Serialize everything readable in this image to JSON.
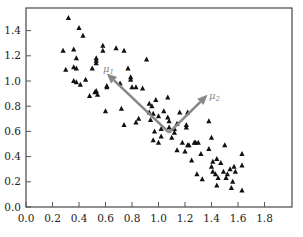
{
  "chart_data": {
    "type": "scatter",
    "title": "",
    "xlabel": "",
    "ylabel": "",
    "xlim": [
      0.0,
      2.0
    ],
    "ylim": [
      0.0,
      1.58
    ],
    "grid": false,
    "legend": null,
    "x_ticks": [
      "0.0",
      "0.2",
      "0.4",
      "0.6",
      "0.8",
      "1.0",
      "1.2",
      "1.4",
      "1.6",
      "1.8"
    ],
    "y_ticks": [
      "0.0",
      "0.2",
      "0.4",
      "0.6",
      "0.8",
      "1.0",
      "1.2",
      "1.4"
    ],
    "marker": "triangle",
    "marker_color": "#111111",
    "points": [
      [
        0.32,
        1.5
      ],
      [
        0.4,
        1.42
      ],
      [
        0.43,
        1.36
      ],
      [
        0.28,
        1.24
      ],
      [
        0.36,
        1.25
      ],
      [
        0.58,
        1.28
      ],
      [
        0.58,
        1.24
      ],
      [
        0.68,
        1.26
      ],
      [
        0.74,
        1.24
      ],
      [
        0.53,
        1.18
      ],
      [
        0.53,
        1.16
      ],
      [
        0.53,
        1.14
      ],
      [
        0.38,
        1.18
      ],
      [
        0.36,
        1.11
      ],
      [
        0.38,
        1.1
      ],
      [
        0.3,
        1.09
      ],
      [
        0.5,
        1.1
      ],
      [
        0.77,
        1.1
      ],
      [
        0.45,
        1.01
      ],
      [
        0.36,
        1.0
      ],
      [
        0.38,
        0.99
      ],
      [
        0.41,
        0.97
      ],
      [
        0.53,
        0.92
      ],
      [
        0.52,
        0.91
      ],
      [
        0.54,
        0.89
      ],
      [
        0.48,
        0.88
      ],
      [
        0.61,
        0.96
      ],
      [
        0.61,
        0.95
      ],
      [
        0.71,
        0.98
      ],
      [
        0.79,
        1.03
      ],
      [
        0.79,
        1.01
      ],
      [
        0.91,
        1.17
      ],
      [
        0.83,
        0.95
      ],
      [
        0.8,
        0.95
      ],
      [
        0.88,
        0.94
      ],
      [
        0.6,
        0.76
      ],
      [
        0.72,
        0.78
      ],
      [
        0.98,
        0.85
      ],
      [
        0.93,
        0.82
      ],
      [
        0.95,
        0.8
      ],
      [
        1.07,
        0.87
      ],
      [
        0.96,
        0.74
      ],
      [
        0.93,
        0.75
      ],
      [
        0.94,
        0.69
      ],
      [
        0.85,
        0.7
      ],
      [
        0.83,
        0.67
      ],
      [
        0.74,
        0.65
      ],
      [
        1.04,
        0.76
      ],
      [
        1.0,
        0.72
      ],
      [
        1.07,
        0.71
      ],
      [
        1.02,
        0.62
      ],
      [
        0.97,
        0.6
      ],
      [
        1.08,
        0.68
      ],
      [
        1.08,
        0.63
      ],
      [
        1.12,
        0.62
      ],
      [
        1.02,
        0.56
      ],
      [
        1.14,
        0.66
      ],
      [
        1.12,
        0.59
      ],
      [
        0.96,
        0.53
      ],
      [
        1.0,
        0.51
      ],
      [
        1.16,
        0.75
      ],
      [
        1.22,
        0.75
      ],
      [
        1.21,
        0.65
      ],
      [
        1.21,
        0.63
      ],
      [
        1.1,
        0.55
      ],
      [
        1.18,
        0.51
      ],
      [
        1.22,
        0.49
      ],
      [
        1.23,
        0.49
      ],
      [
        1.14,
        0.45
      ],
      [
        1.2,
        0.44
      ],
      [
        1.27,
        0.51
      ],
      [
        1.28,
        0.51
      ],
      [
        1.3,
        0.51
      ],
      [
        1.38,
        0.68
      ],
      [
        1.4,
        0.55
      ],
      [
        1.38,
        0.46
      ],
      [
        1.25,
        0.37
      ],
      [
        1.32,
        0.42
      ],
      [
        1.5,
        0.49
      ],
      [
        1.41,
        0.36
      ],
      [
        1.4,
        0.32
      ],
      [
        1.44,
        0.38
      ],
      [
        1.47,
        0.35
      ],
      [
        1.29,
        0.26
      ],
      [
        1.33,
        0.22
      ],
      [
        1.41,
        0.28
      ],
      [
        1.43,
        0.26
      ],
      [
        1.49,
        0.28
      ],
      [
        1.52,
        0.26
      ],
      [
        1.54,
        0.3
      ],
      [
        1.57,
        0.32
      ],
      [
        1.58,
        0.28
      ],
      [
        1.45,
        0.23
      ],
      [
        1.51,
        0.23
      ],
      [
        1.56,
        0.2
      ],
      [
        1.63,
        0.42
      ],
      [
        1.63,
        0.33
      ],
      [
        1.44,
        0.17
      ],
      [
        1.55,
        0.15
      ],
      [
        1.63,
        0.13
      ]
    ],
    "annotations": [
      {
        "label": "μ1",
        "type": "arrow",
        "from": [
          1.08,
          0.59
        ],
        "to": [
          0.61,
          1.06
        ],
        "color": "#888888"
      },
      {
        "label": "μ2",
        "type": "arrow",
        "from": [
          1.08,
          0.59
        ],
        "to": [
          1.37,
          0.89
        ],
        "color": "#888888"
      }
    ]
  },
  "labels": {
    "mu1_base": "μ",
    "mu1_sub": "1",
    "mu2_base": "μ",
    "mu2_sub": "2"
  }
}
